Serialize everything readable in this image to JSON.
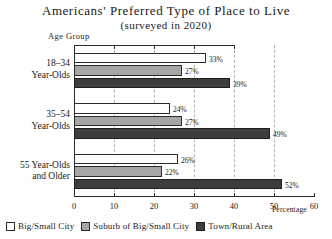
{
  "chart_data": {
    "type": "bar",
    "orientation": "horizontal",
    "title": "Americans' Preferred Type of Place to Live",
    "subtitle": "(surveyed in 2020)",
    "xlabel": "Percentage",
    "ylabel": "Age Group",
    "xlim": [
      0,
      60
    ],
    "xticks": [
      0,
      10,
      20,
      30,
      40,
      50,
      60
    ],
    "xtick_labels": [
      "0",
      "10",
      "20",
      "30",
      "40",
      "50",
      "60"
    ],
    "grid": "vertical dashed gridlines at 10, 20, 30, 40, 50",
    "legend_position": "below-plot-left",
    "categories": [
      "18-34 Year-Olds",
      "35-54 Year-Olds",
      "55 Year-Olds and Older"
    ],
    "category_lines": [
      [
        "18–34",
        "Year-Olds"
      ],
      [
        "35–54",
        "Year-Olds"
      ],
      [
        "55  Year-Olds",
        "and Older"
      ]
    ],
    "series": [
      {
        "name": "Big/Small City",
        "color": "#ffffff",
        "values": [
          33,
          24,
          26
        ],
        "labels": [
          "33%",
          "24%",
          "26%"
        ]
      },
      {
        "name": "Suburb of Big/Small City",
        "color": "#a6a6a6",
        "values": [
          27,
          27,
          22
        ],
        "labels": [
          "27%",
          "27%",
          "22%"
        ]
      },
      {
        "name": "Town/Rural Area",
        "color": "#3d3d3d",
        "values": [
          39,
          49,
          52
        ],
        "labels": [
          "39%",
          "49%",
          "52%"
        ]
      }
    ]
  },
  "legend": [
    {
      "label": "Big/Small City",
      "swatch": "white-swatch"
    },
    {
      "label": "Suburb of Big/Small City",
      "swatch": "gray-swatch"
    },
    {
      "label": "Town/Rural Area",
      "swatch": "dark-swatch"
    }
  ],
  "colors": {
    "big_small_city": "#ffffff",
    "suburb": "#a6a6a6",
    "town_rural": "#3d3d3d",
    "axis": "#2b2b2b",
    "gridline": "#b4b4b4"
  }
}
